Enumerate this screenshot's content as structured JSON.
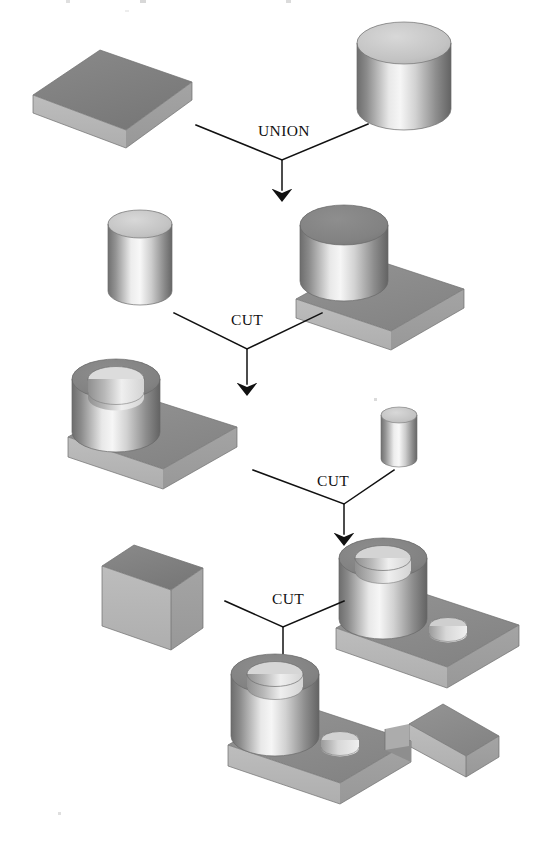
{
  "figure": {
    "background_color": "#ffffff",
    "width": 542,
    "height": 846
  },
  "palette": {
    "top_face_dark": "#7c7c7c",
    "top_face_mid": "#8a8a8a",
    "front_face": "#9b9b9b",
    "side_face_light": "#b4b4b4",
    "cyl_top_light": "#c9c9c9",
    "cyl_top_dark": "#8b8b8b",
    "highlight": "#f2f2f2",
    "shadow": "#5f5f5f",
    "outline": "#6e6e6e",
    "ink": "#111111"
  },
  "operations": [
    {
      "id": "op-union-1",
      "label": "UNION",
      "x": 284,
      "y": 136,
      "left_from": [
        196,
        125
      ],
      "right_from": [
        368,
        124
      ],
      "apex": [
        282,
        160
      ],
      "arrow_to": [
        282,
        196
      ]
    },
    {
      "id": "op-cut-1",
      "label": "CUT",
      "x": 247,
      "y": 325,
      "left_from": [
        174,
        313
      ],
      "right_from": [
        322,
        313
      ],
      "apex": [
        247,
        349
      ],
      "arrow_to": [
        247,
        390
      ]
    },
    {
      "id": "op-cut-2",
      "label": "CUT",
      "x": 333,
      "y": 486,
      "left_from": [
        253,
        470
      ],
      "right_from": [
        394,
        470
      ],
      "apex": [
        344,
        504
      ],
      "arrow_to": [
        344,
        540
      ]
    },
    {
      "id": "op-cut-3",
      "label": "CUT",
      "x": 288,
      "y": 604,
      "left_from": [
        225,
        601
      ],
      "right_from": [
        344,
        601
      ],
      "apex": [
        283,
        627
      ],
      "arrow_to": [
        283,
        663
      ]
    }
  ],
  "primitives": [
    {
      "id": "block-a",
      "name": "rectangular-block",
      "role": "operand",
      "level": 1,
      "label": ""
    },
    {
      "id": "cylinder-a",
      "name": "large-cylinder",
      "role": "operand",
      "level": 1,
      "label": ""
    },
    {
      "id": "boss-on-plate",
      "name": "cylinder-on-block",
      "role": "result",
      "level": 2,
      "label": ""
    },
    {
      "id": "cylinder-b",
      "name": "medium-cylinder-tool",
      "role": "operand",
      "level": 2,
      "label": ""
    },
    {
      "id": "bored-boss-plate",
      "name": "bored-boss-on-plate",
      "role": "result",
      "level": 3,
      "label": ""
    },
    {
      "id": "cylinder-c",
      "name": "small-cylinder-tool",
      "role": "operand",
      "level": 3,
      "label": ""
    },
    {
      "id": "two-hole-bracket",
      "name": "bracket-with-two-holes",
      "role": "result",
      "level": 4,
      "label": ""
    },
    {
      "id": "block-b",
      "name": "slot-cutting-block",
      "role": "operand",
      "level": 4,
      "label": ""
    },
    {
      "id": "final-bracket",
      "name": "final-slotted-bracket",
      "role": "result",
      "level": 5,
      "label": ""
    }
  ],
  "tree_summary": {
    "step_1": "block-a UNION cylinder-a -> boss-on-plate",
    "step_2": "boss-on-plate CUT cylinder-b -> bored-boss-plate",
    "step_3": "bored-boss-plate CUT cylinder-c -> two-hole-bracket",
    "step_4": "two-hole-bracket CUT block-b -> final-slotted-bracket"
  }
}
